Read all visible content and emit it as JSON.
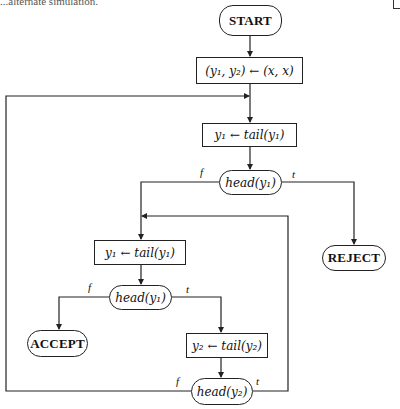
{
  "header": {
    "fragment": "...alternate simulation."
  },
  "flowchart": {
    "nodes": {
      "start": {
        "label": "START",
        "shape": "terminal"
      },
      "init": {
        "label": "(y₁, y₂) ← (x, x)",
        "shape": "process"
      },
      "tail_y1_a": {
        "label": "y₁ ← tail(y₁)",
        "shape": "process"
      },
      "head_y1_a": {
        "label": "head(y₁)",
        "shape": "decision"
      },
      "reject": {
        "label": "REJECT",
        "shape": "terminal"
      },
      "tail_y1_b": {
        "label": "y₁ ← tail(y₁)",
        "shape": "process"
      },
      "head_y1_b": {
        "label": "head(y₁)",
        "shape": "decision"
      },
      "accept": {
        "label": "ACCEPT",
        "shape": "terminal"
      },
      "tail_y2": {
        "label": "y₂ ← tail(y₂)",
        "shape": "process"
      },
      "head_y2": {
        "label": "head(y₂)",
        "shape": "decision"
      }
    },
    "edge_labels": {
      "head_y1_a_false": "f",
      "head_y1_a_true": "t",
      "head_y1_b_false": "f",
      "head_y1_b_true": "t",
      "head_y2_false": "f",
      "head_y2_true": "t"
    },
    "edges": [
      {
        "from": "start",
        "to": "init"
      },
      {
        "from": "init",
        "to": "tail_y1_a"
      },
      {
        "from": "tail_y1_a",
        "to": "head_y1_a"
      },
      {
        "from": "head_y1_a",
        "to": "tail_y1_b",
        "label": "f"
      },
      {
        "from": "head_y1_a",
        "to": "reject",
        "label": "t"
      },
      {
        "from": "tail_y1_b",
        "to": "head_y1_b"
      },
      {
        "from": "head_y1_b",
        "to": "accept",
        "label": "f"
      },
      {
        "from": "head_y1_b",
        "to": "tail_y2",
        "label": "t"
      },
      {
        "from": "tail_y2",
        "to": "head_y2"
      },
      {
        "from": "head_y2",
        "to": "tail_y1_a",
        "label": "f"
      },
      {
        "from": "head_y2",
        "to": "tail_y1_b",
        "label": "t"
      }
    ]
  },
  "colors": {
    "line": "#222222",
    "background": "#ffffff"
  }
}
